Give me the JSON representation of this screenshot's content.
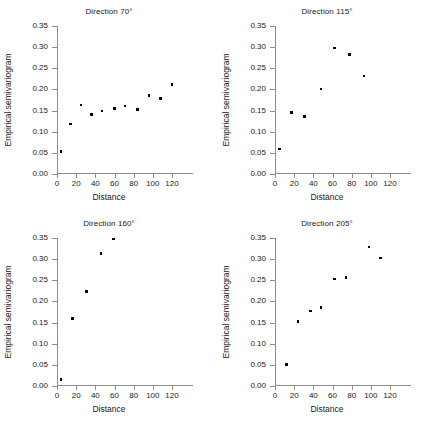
{
  "figure": {
    "axis_color": "#8c8c8c",
    "marker_color": "#000000",
    "background": "#ffffff",
    "xlabel": "Distance",
    "ylabel": "Empirical semivariogram",
    "xticks": [
      "0",
      "20",
      "40",
      "60",
      "80",
      "100",
      "120"
    ],
    "yticks": [
      "0.00",
      "0.05",
      "0.10",
      "0.15",
      "0.20",
      "0.25",
      "0.30",
      "0.35"
    ]
  },
  "chart_data": [
    {
      "type": "scatter",
      "title": "Direction 70°",
      "xlabel": "Distance",
      "ylabel": "Empirical semivariogram",
      "xlim": [
        0,
        120
      ],
      "ylim": [
        0.0,
        0.35
      ],
      "xticks": [
        0,
        20,
        40,
        60,
        80,
        100,
        120
      ],
      "yticks": [
        0.0,
        0.05,
        0.1,
        0.15,
        0.2,
        0.25,
        0.3,
        0.35
      ],
      "grid": false,
      "legend": null,
      "x": [
        4,
        14,
        25,
        36,
        47,
        60,
        71,
        84,
        96,
        108,
        120
      ],
      "y": [
        0.053,
        0.118,
        0.163,
        0.141,
        0.149,
        0.155,
        0.161,
        0.152,
        0.185,
        0.178,
        0.211
      ]
    },
    {
      "type": "scatter",
      "title": "Direction 115°",
      "xlabel": "Distance",
      "ylabel": "Empirical semivariogram",
      "xlim": [
        0,
        120
      ],
      "ylim": [
        0.0,
        0.35
      ],
      "xticks": [
        0,
        20,
        40,
        60,
        80,
        100,
        120
      ],
      "yticks": [
        0.0,
        0.05,
        0.1,
        0.15,
        0.2,
        0.25,
        0.3,
        0.35
      ],
      "grid": false,
      "legend": null,
      "x": [
        5,
        17,
        31,
        48,
        62,
        78,
        93
      ],
      "y": [
        0.059,
        0.146,
        0.136,
        0.201,
        0.298,
        0.282,
        0.232
      ]
    },
    {
      "type": "scatter",
      "title": "Direction 160°",
      "xlabel": "Distance",
      "ylabel": "Empirical semivariogram",
      "xlim": [
        0,
        120
      ],
      "ylim": [
        0.0,
        0.35
      ],
      "xticks": [
        0,
        20,
        40,
        60,
        80,
        100,
        120
      ],
      "yticks": [
        0.0,
        0.05,
        0.1,
        0.15,
        0.2,
        0.25,
        0.3,
        0.35
      ],
      "grid": false,
      "legend": null,
      "x": [
        4,
        16,
        31,
        46,
        59
      ],
      "y": [
        0.015,
        0.16,
        0.223,
        0.314,
        0.348
      ]
    },
    {
      "type": "scatter",
      "title": "Direction 205°",
      "xlabel": "Distance",
      "ylabel": "Empirical semivariogram",
      "xlim": [
        0,
        120
      ],
      "ylim": [
        0.0,
        0.35
      ],
      "xticks": [
        0,
        20,
        40,
        60,
        80,
        100,
        120
      ],
      "yticks": [
        0.0,
        0.05,
        0.1,
        0.15,
        0.2,
        0.25,
        0.3,
        0.35
      ],
      "grid": false,
      "legend": null,
      "x": [
        12,
        24,
        37,
        48,
        62,
        74,
        98,
        110
      ],
      "y": [
        0.051,
        0.152,
        0.177,
        0.186,
        0.253,
        0.256,
        0.329,
        0.303
      ]
    }
  ]
}
